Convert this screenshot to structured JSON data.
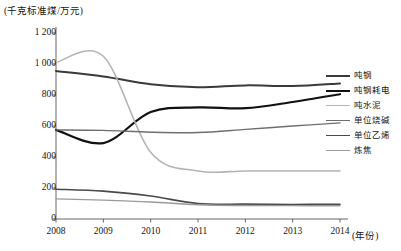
{
  "chart_data": {
    "type": "line",
    "title": "",
    "unit_label": "(千克标准煤/万元)",
    "xlabel": "(年份)",
    "ylabel": "",
    "categories": [
      2008,
      2009,
      2010,
      2011,
      2012,
      2013,
      2014
    ],
    "xlim": [
      2008,
      2014
    ],
    "ylim": [
      0,
      1200
    ],
    "yticks": [
      "0",
      "200",
      "400",
      "600",
      "800",
      "1 000",
      "1 200"
    ],
    "ytick_values": [
      0,
      200,
      400,
      600,
      800,
      1000,
      1200
    ],
    "xticks": [
      "2008",
      "2009",
      "2010",
      "2011",
      "2012",
      "2013",
      "2014"
    ],
    "grid": false,
    "legend_position": "right",
    "series": [
      {
        "name": "吨钢",
        "color": "#3a3a3a",
        "width": 2.0,
        "values": [
          955,
          920,
          870,
          850,
          862,
          858,
          875
        ]
      },
      {
        "name": "吨钢耗电",
        "color": "#111111",
        "width": 2.2,
        "values": [
          575,
          490,
          690,
          720,
          715,
          755,
          805
        ]
      },
      {
        "name": "吨水泥",
        "color": "#b4b4b4",
        "width": 1.6,
        "values": [
          1010,
          1050,
          430,
          310,
          310,
          310,
          310
        ]
      },
      {
        "name": "单位烧碱",
        "color": "#6e6e6e",
        "width": 1.4,
        "values": [
          575,
          572,
          560,
          558,
          578,
          600,
          620
        ]
      },
      {
        "name": "单位乙烯",
        "color": "#4a4a4a",
        "width": 1.6,
        "values": [
          192,
          180,
          148,
          100,
          96,
          94,
          95
        ]
      },
      {
        "name": "炼焦",
        "color": "#9a9a9a",
        "width": 1.4,
        "values": [
          130,
          122,
          110,
          92,
          87,
          86,
          85
        ]
      }
    ]
  }
}
